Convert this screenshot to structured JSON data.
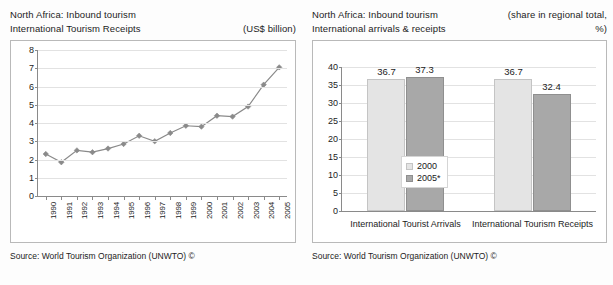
{
  "left_panel": {
    "title_line1": "North Africa: Inbound tourism",
    "title_line2": "International Tourism Receipts",
    "unit": "(US$ billion)",
    "source": "Source: World Tourism Organization (UNWTO) ©"
  },
  "right_panel": {
    "title_line1": "North Africa: Inbound tourism",
    "title_line2": "International arrivals & receipts",
    "unit_line1": "(share in regional total,",
    "unit_line2": "%)",
    "source": "Source: World Tourism Organization (UNWTO) ©"
  },
  "chart_data": [
    {
      "type": "line",
      "title": "North Africa: Inbound tourism - International Tourism Receipts",
      "xlabel": "",
      "ylabel": "US$ billion",
      "ylim": [
        0,
        8
      ],
      "ytick_labels": [
        "0",
        "1",
        "2",
        "3",
        "4",
        "5",
        "6",
        "7",
        "8"
      ],
      "yticks": [
        0,
        1,
        2,
        3,
        4,
        5,
        6,
        7,
        8
      ],
      "grid": true,
      "legend": "none",
      "marker": "diamond",
      "series_color": "#8a8a8a",
      "categories": [
        "1990",
        "1991",
        "1992",
        "1993",
        "1994",
        "1995",
        "1996",
        "1997",
        "1998",
        "1999",
        "2000",
        "2001",
        "2002",
        "2003",
        "2004",
        "2005"
      ],
      "values": [
        2.3,
        1.85,
        2.5,
        2.4,
        2.6,
        2.85,
        3.3,
        3.0,
        3.45,
        3.85,
        3.8,
        4.4,
        4.35,
        4.9,
        6.1,
        7.05
      ]
    },
    {
      "type": "bar",
      "title": "North Africa: Inbound tourism - International arrivals & receipts",
      "xlabel": "",
      "ylabel": "share in regional total, %",
      "ylim": [
        0,
        40
      ],
      "ytick_labels": [
        "0",
        "5",
        "10",
        "15",
        "20",
        "25",
        "30",
        "35",
        "40"
      ],
      "yticks": [
        0,
        5,
        10,
        15,
        20,
        25,
        30,
        35,
        40
      ],
      "grid": true,
      "legend_position": "center",
      "categories": [
        "International Tourist Arrivals",
        "International Tourism Receipts"
      ],
      "series": [
        {
          "name": "2000",
          "color": "#e4e4e4",
          "values": [
            36.7,
            36.7
          ]
        },
        {
          "name": "2005*",
          "color": "#a8a8a8",
          "values": [
            37.3,
            32.4
          ]
        }
      ]
    }
  ]
}
